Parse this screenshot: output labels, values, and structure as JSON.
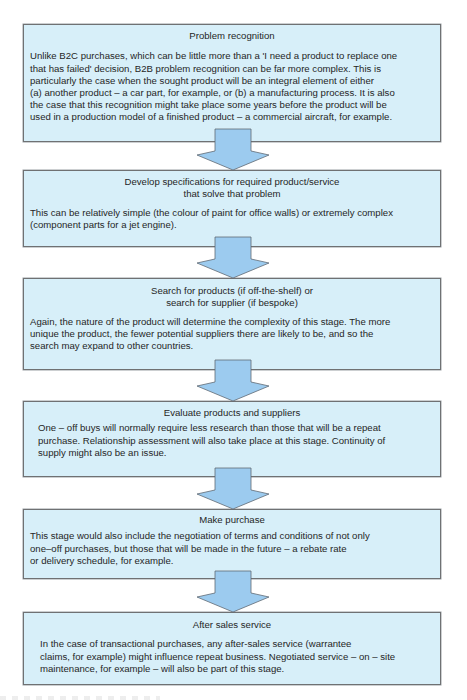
{
  "diagram": {
    "type": "flowchart",
    "direction": "top-to-bottom",
    "colors": {
      "box_fill": "#d7eff9",
      "box_border": "#6f7173",
      "arrow_fill": "#9ccbef",
      "arrow_stroke": "#5f6a73",
      "text": "#262626"
    },
    "steps": [
      {
        "title": "Problem recognition",
        "body": "Unlike B2C purchases, which can be little more than a 'I need a product to replace one\nthat has failed' decision, B2B problem recognition can be far more complex. This is\nparticularly the case when the sought product will be an integral element of either\n(a) another product – a car part, for example, or (b) a manufacturing process. It is also\nthe case that this recognition might take place some years before the product will be\nused in a production model of a finished product – a commercial aircraft, for example."
      },
      {
        "title": "Develop specifications for required product/service\nthat solve that problem",
        "body": "This can be relatively simple (the colour of paint for office walls) or extremely complex\n(component parts for a jet engine)."
      },
      {
        "title": "Search for products (if off-the-shelf) or\nsearch for supplier (if bespoke)",
        "body": "Again, the nature of the product will determine the complexity of this stage. The more\nunique the product, the fewer potential suppliers there are likely to be, and so the\nsearch may expand to other countries."
      },
      {
        "title": "Evaluate products and suppliers",
        "body": "One – off buys will normally require less research than those that will be a repeat\npurchase. Relationship assessment will also take place at this stage. Continuity of\nsupply might also be an issue."
      },
      {
        "title": "Make purchase",
        "body": "This stage would also include the negotiation of terms and conditions of not only\none–off purchases, but those that will be made in the future – a rebate rate\nor delivery schedule, for example."
      },
      {
        "title": "After sales service",
        "body": "In the case of transactional purchases, any after-sales service (warrantee\nclaims, for example) might influence repeat business. Negotiated service – on – site\nmaintenance, for example – will also be part of this stage."
      }
    ],
    "connectors": [
      {
        "from": 0,
        "to": 1,
        "icon": "down-arrow-icon"
      },
      {
        "from": 1,
        "to": 2,
        "icon": "down-arrow-icon"
      },
      {
        "from": 2,
        "to": 3,
        "icon": "down-arrow-icon"
      },
      {
        "from": 3,
        "to": 4,
        "icon": "down-arrow-icon"
      },
      {
        "from": 4,
        "to": 5,
        "icon": "down-arrow-icon"
      }
    ]
  }
}
